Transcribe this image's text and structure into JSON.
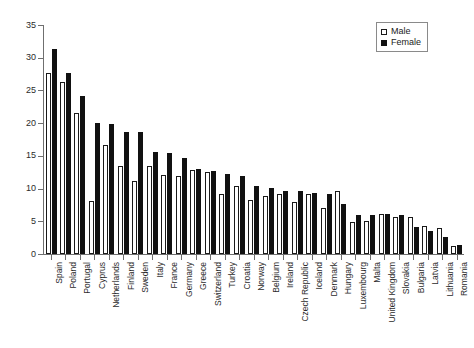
{
  "chart_data": {
    "type": "bar",
    "title": "",
    "subtitle": "",
    "xlabel": "",
    "ylabel": "",
    "ylim": [
      0,
      35
    ],
    "ytick_labels": [
      "0",
      "5",
      "10",
      "15",
      "20",
      "25",
      "30",
      "35"
    ],
    "ytick_values": [
      0,
      5,
      10,
      15,
      20,
      25,
      30,
      35
    ],
    "grid": false,
    "legend_position": "top-right",
    "categories": [
      "Spain",
      "Poland",
      "Portugal",
      "Cyprus",
      "Netherlands",
      "Finland",
      "Sweden",
      "Italy",
      "France",
      "Germany",
      "Greece",
      "Switzerland",
      "Turkey",
      "Croatia",
      "Norway",
      "Belgium",
      "Ireland",
      "Czech Republic",
      "Iceland",
      "Denmark",
      "Hungary",
      "Luxembourg",
      "Malta",
      "United Kingdom",
      "Slovakia",
      "Bulgaria",
      "Latvia",
      "Lithuania",
      "Romania"
    ],
    "series": [
      {
        "name": "Male",
        "color": "#ffffff",
        "values": [
          27.6,
          26.3,
          21.6,
          8.1,
          16.6,
          13.4,
          11.2,
          13.4,
          12.1,
          11.9,
          12.8,
          12.6,
          9.1,
          10.4,
          8.2,
          8.9,
          9.2,
          7.9,
          9.2,
          7.0,
          9.6,
          4.9,
          5.1,
          6.1,
          5.7,
          5.7,
          4.3,
          3.9,
          1.2
        ]
      },
      {
        "name": "Female",
        "color": "#111111",
        "values": [
          31.4,
          27.7,
          24.2,
          20.1,
          19.9,
          18.7,
          18.7,
          15.6,
          15.4,
          14.7,
          13.0,
          12.7,
          12.2,
          12.0,
          10.4,
          10.1,
          9.7,
          9.6,
          9.3,
          9.1,
          7.7,
          5.9,
          6.0,
          6.1,
          5.9,
          4.2,
          3.5,
          2.6,
          1.4
        ]
      }
    ]
  },
  "legend": {
    "items": [
      {
        "label": "Male"
      },
      {
        "label": "Female"
      }
    ]
  }
}
